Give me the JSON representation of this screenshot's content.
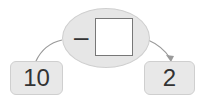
{
  "diagram": {
    "start_value": "10",
    "operator": "–",
    "blank_value": "",
    "result_value": "2",
    "colors": {
      "box_fill": "#e8e8e8",
      "ellipse_fill": "#e6e6e6",
      "arrow": "#999999",
      "text": "#333333"
    }
  }
}
